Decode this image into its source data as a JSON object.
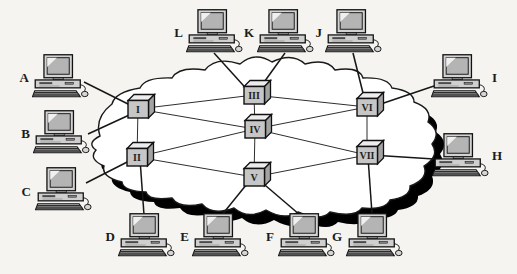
{
  "diagram": {
    "type": "network-topology",
    "computers": [
      {
        "label": "A"
      },
      {
        "label": "B"
      },
      {
        "label": "C"
      },
      {
        "label": "D"
      },
      {
        "label": "E"
      },
      {
        "label": "F"
      },
      {
        "label": "G"
      },
      {
        "label": "H"
      },
      {
        "label": "I"
      },
      {
        "label": "J"
      },
      {
        "label": "K"
      },
      {
        "label": "L"
      }
    ],
    "routers": [
      {
        "label": "I"
      },
      {
        "label": "II"
      },
      {
        "label": "III"
      },
      {
        "label": "IV"
      },
      {
        "label": "V"
      },
      {
        "label": "VI"
      },
      {
        "label": "VII"
      }
    ],
    "router_links": [
      [
        "I",
        "II"
      ],
      [
        "I",
        "III"
      ],
      [
        "I",
        "IV"
      ],
      [
        "II",
        "IV"
      ],
      [
        "II",
        "V"
      ],
      [
        "III",
        "IV"
      ],
      [
        "III",
        "VI"
      ],
      [
        "IV",
        "V"
      ],
      [
        "IV",
        "VI"
      ],
      [
        "IV",
        "VII"
      ],
      [
        "V",
        "VII"
      ],
      [
        "VI",
        "VII"
      ]
    ],
    "computer_links": [
      [
        "A",
        "I"
      ],
      [
        "B",
        "I"
      ],
      [
        "C",
        "II"
      ],
      [
        "D",
        "II"
      ],
      [
        "E",
        "V"
      ],
      [
        "F",
        "V"
      ],
      [
        "G",
        "VII"
      ],
      [
        "H",
        "VII"
      ],
      [
        "I",
        "VI"
      ],
      [
        "J",
        "VI"
      ],
      [
        "K",
        "III"
      ],
      [
        "L",
        "III"
      ]
    ],
    "colors": {
      "background": "#f5f4f1",
      "cloud_fill": "#ffffff",
      "cloud_shadow": "#000000",
      "outline": "#1a1a1a",
      "router_face": "#c6c6c6"
    }
  }
}
